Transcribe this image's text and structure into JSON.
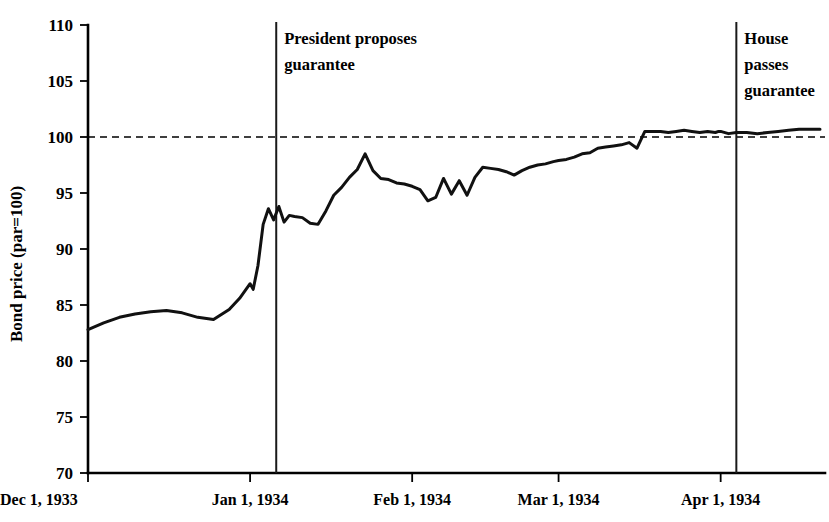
{
  "chart_data": {
    "type": "line",
    "title": "",
    "xlabel": "",
    "ylabel": "Bond price (par=100)",
    "ylim": [
      70,
      110
    ],
    "yticks": [
      70,
      75,
      80,
      85,
      90,
      95,
      100,
      105,
      110
    ],
    "ytick_labels": [
      "70",
      "75",
      "80",
      "85",
      "90",
      "95",
      "100",
      "105",
      "110"
    ],
    "xlim": [
      0,
      140
    ],
    "xticks": [
      0,
      31,
      62,
      90,
      121
    ],
    "xtick_labels": [
      "Dec 1, 1933",
      "Jan 1, 1934",
      "Feb 1, 1934",
      "Mar 1, 1934",
      "Apr 1, 1934"
    ],
    "grid": false,
    "legend": null,
    "reference_lines": [
      {
        "name": "par-value-line",
        "orientation": "horizontal",
        "value": 100,
        "style": "dashed",
        "label": ""
      }
    ],
    "annotations": [
      {
        "name": "president-proposes-guarantee",
        "x": 36,
        "lines": [
          "President proposes",
          "guarantee"
        ]
      },
      {
        "name": "house-passes-guarantee",
        "x": 124,
        "lines": [
          "House",
          "passes",
          "guarantee"
        ]
      }
    ],
    "series": [
      {
        "name": "Bond price",
        "x": [
          0,
          3,
          6,
          9,
          12,
          15,
          18,
          21,
          24,
          27,
          29,
          31,
          31.6,
          32.5,
          33.5,
          34.5,
          35.5,
          36.5,
          37.5,
          38.5,
          39.5,
          41,
          42.5,
          44,
          45.5,
          47,
          48.5,
          50,
          51.5,
          53,
          54.5,
          56,
          57.5,
          59,
          60.5,
          62,
          63.5,
          65,
          66.5,
          68,
          69.5,
          71,
          72.5,
          74,
          75.5,
          77,
          78.5,
          80,
          81.5,
          83,
          84.5,
          86,
          87.5,
          89,
          90,
          91.5,
          93,
          94.5,
          96,
          97.5,
          99,
          100.5,
          102,
          103.5,
          105,
          106.5,
          108,
          109.5,
          111,
          112.5,
          114,
          115.5,
          117,
          118.5,
          120,
          120.6,
          121,
          122.5,
          124,
          126,
          128,
          130,
          132,
          134,
          136,
          138,
          140
        ],
        "values": [
          82.8,
          83.4,
          83.9,
          84.2,
          84.4,
          84.5,
          84.3,
          83.9,
          83.7,
          84.6,
          85.6,
          86.9,
          86.4,
          88.5,
          92.2,
          93.6,
          92.6,
          93.8,
          92.4,
          93.0,
          92.9,
          92.8,
          92.3,
          92.2,
          93.4,
          94.8,
          95.5,
          96.4,
          97.1,
          98.5,
          97.0,
          96.3,
          96.2,
          95.9,
          95.8,
          95.6,
          95.3,
          94.3,
          94.6,
          96.3,
          94.9,
          96.1,
          94.8,
          96.4,
          97.3,
          97.2,
          97.1,
          96.9,
          96.6,
          97.0,
          97.3,
          97.5,
          97.6,
          97.8,
          97.9,
          98.0,
          98.2,
          98.5,
          98.6,
          99.0,
          99.1,
          99.2,
          99.3,
          99.5,
          99.0,
          100.5,
          100.5,
          100.5,
          100.4,
          100.5,
          100.6,
          100.5,
          100.4,
          100.5,
          100.4,
          100.5,
          100.5,
          100.3,
          100.4,
          100.4,
          100.3,
          100.4,
          100.5,
          100.6,
          100.7,
          100.7,
          100.7
        ]
      }
    ]
  },
  "layout": {
    "plot_left": 88,
    "plot_right": 820,
    "plot_top": 25,
    "plot_bottom": 473
  }
}
